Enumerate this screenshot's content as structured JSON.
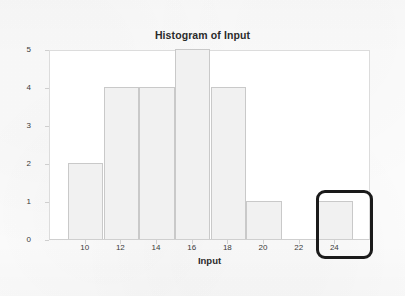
{
  "chart_data": {
    "type": "bar",
    "title": "Histogram of Input",
    "xlabel": "Input",
    "ylabel": "Frequency",
    "xlim": [
      8,
      26
    ],
    "ylim": [
      0,
      5
    ],
    "grid": false,
    "legend": null,
    "bin_width": 2,
    "categories": [
      "9-11",
      "11-13",
      "13-15",
      "15-17",
      "17-19",
      "19-21",
      "21-23",
      "23-25"
    ],
    "bins": [
      {
        "start": 9,
        "end": 11,
        "value": 2
      },
      {
        "start": 11,
        "end": 13,
        "value": 4
      },
      {
        "start": 13,
        "end": 15,
        "value": 4
      },
      {
        "start": 15,
        "end": 17,
        "value": 5
      },
      {
        "start": 17,
        "end": 19,
        "value": 4
      },
      {
        "start": 19,
        "end": 21,
        "value": 1
      },
      {
        "start": 21,
        "end": 23,
        "value": 0
      },
      {
        "start": 23,
        "end": 25,
        "value": 1
      }
    ],
    "values": [
      2,
      4,
      4,
      5,
      4,
      1,
      0,
      1
    ],
    "xticks": [
      10,
      12,
      14,
      16,
      18,
      20,
      22,
      24
    ],
    "yticks": [
      0,
      1,
      2,
      3,
      4,
      5
    ],
    "annotations": [
      {
        "name": "outlier-highlight",
        "shape": "rounded-rectangle",
        "covers_bin": "23-25",
        "covers_tick": "24",
        "color": "#1a1a1a"
      }
    ]
  },
  "colors": {
    "page_background": "#fbfbfb",
    "plot_background": "#ffffff",
    "bar_fill": "#f1f1f1",
    "bar_border": "#c9c9c9",
    "axis": "#cfcfcf",
    "text": "#2b2b2b",
    "highlight": "#1a1a1a"
  }
}
